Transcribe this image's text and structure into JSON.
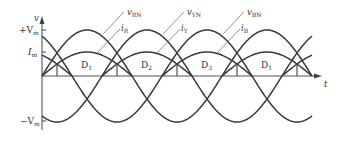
{
  "diagram": {
    "axes": {
      "y_label": "v",
      "x_label": "t",
      "ticks": [
        {
          "label": "+V",
          "sub": "m",
          "level": "Vm"
        },
        {
          "label": "I",
          "sub": "m",
          "level": "Im"
        },
        {
          "label": "−V",
          "sub": "m",
          "level": "-Vm"
        }
      ]
    },
    "labels": {
      "vRN": {
        "main": "v",
        "sub": "RN"
      },
      "vYN": {
        "main": "v",
        "sub": "YN"
      },
      "vBN": {
        "main": "v",
        "sub": "BN"
      },
      "iR": {
        "main": "i",
        "sub": "R"
      },
      "iY": {
        "main": "i",
        "sub": "Y"
      },
      "iB": {
        "main": "i",
        "sub": "B"
      }
    },
    "intervals": [
      {
        "main": "D",
        "sub": "1"
      },
      {
        "main": "D",
        "sub": "2"
      },
      {
        "main": "D",
        "sub": "3"
      },
      {
        "main": "D",
        "sub": "1"
      }
    ],
    "geometry": {
      "origin_x": 42,
      "axis_y": 76,
      "px_per_cycle": 180,
      "voltage_amplitude_px": 46,
      "current_amplitude_px": 24,
      "phase_peaks_x": {
        "R": 87,
        "Y": 147,
        "B": 207
      },
      "x_end": 312
    },
    "colors": {
      "curve": "#3a3a3a",
      "axis": "#555555",
      "leader": "#777777"
    }
  }
}
